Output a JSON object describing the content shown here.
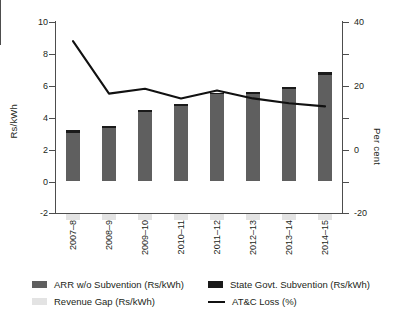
{
  "chart_data": {
    "type": "bar",
    "title": "",
    "categories": [
      "2007–8",
      "2008–9",
      "2009–10",
      "2010–11",
      "2011–12",
      "2012–13",
      "2013–14",
      "2014–15"
    ],
    "series": [
      {
        "name": "ARR w/o Subvention (Rs/kWh)",
        "type": "bar",
        "axis": "left",
        "color": "#5f5f5f",
        "values": [
          3.2,
          3.45,
          4.45,
          4.85,
          5.55,
          5.6,
          5.9,
          6.85
        ]
      },
      {
        "name": "State Govt. Subvention (Rs/kWh)",
        "type": "bar",
        "axis": "left",
        "color": "#1a1a1a",
        "values": [
          0.15,
          0.1,
          0.1,
          0.15,
          0.1,
          0.1,
          0.1,
          0.15
        ]
      },
      {
        "name": "Revenue Gap (Rs/kWh)",
        "type": "bar",
        "axis": "left",
        "color": "#e3e3e3",
        "values": [
          -0.35,
          -0.35,
          -0.4,
          -0.4,
          -0.35,
          -0.35,
          -0.35,
          -0.4
        ]
      },
      {
        "name": "AT&C Loss (%)",
        "type": "line",
        "axis": "right",
        "color": "#111111",
        "values": [
          34.0,
          17.5,
          19.0,
          16.0,
          18.5,
          16.0,
          14.5,
          13.5
        ]
      }
    ],
    "ylabel": "Rs/kWh",
    "ylim": [
      -2,
      10
    ],
    "yticks": [
      -2,
      0,
      2,
      4,
      6,
      8,
      10
    ],
    "y2label": "Per cent",
    "y2lim": [
      -20,
      40
    ],
    "y2ticks": [
      -20,
      0,
      20,
      40
    ],
    "xlabel": "",
    "grid": false,
    "legend_position": "bottom"
  },
  "axes": {
    "left": {
      "title": "Rs/kWh",
      "ticks": [
        {
          "label": "10",
          "value": 10
        },
        {
          "label": "8",
          "value": 8
        },
        {
          "label": "6",
          "value": 6
        },
        {
          "label": "4",
          "value": 4
        },
        {
          "label": "2",
          "value": 2
        },
        {
          "label": "0",
          "value": 0
        },
        {
          "label": "-2",
          "value": -2
        }
      ]
    },
    "right": {
      "title": "Per cent",
      "ticks": [
        {
          "label": "40",
          "value": 40
        },
        {
          "label": "20",
          "value": 20
        },
        {
          "label": "0",
          "value": 0
        },
        {
          "label": "-20",
          "value": -20
        }
      ]
    }
  },
  "legend": {
    "items": [
      {
        "label": "ARR w/o Subvention (Rs/kWh)",
        "marker": "swatch",
        "color": "#5f5f5f"
      },
      {
        "label": "State Govt. Subvention (Rs/kWh)",
        "marker": "swatch",
        "color": "#1a1a1a"
      },
      {
        "label": "Revenue Gap (Rs/kWh)",
        "marker": "swatch",
        "color": "#e3e3e3"
      },
      {
        "label": "AT&C Loss (%)",
        "marker": "line",
        "color": "#111111"
      }
    ]
  }
}
